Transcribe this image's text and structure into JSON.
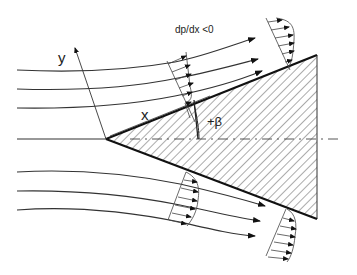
{
  "diagram": {
    "labels": {
      "pressure_gradient": "dp/dx <0",
      "x_axis": "x",
      "y_axis": "y",
      "wedge_angle": "+β"
    },
    "geometry": {
      "apex": [
        106,
        139
      ],
      "top_right": [
        317,
        55
      ],
      "bottom_right": [
        317,
        219
      ],
      "centerline_y": 139
    },
    "elements": {
      "upper_streamlines": 3,
      "lower_streamlines": 3,
      "velocity_profiles": 4,
      "hatched_region": "wedge body",
      "symmetry_line": "dash-dot"
    },
    "colors": {
      "line": "#222222",
      "background": "#ffffff"
    }
  }
}
